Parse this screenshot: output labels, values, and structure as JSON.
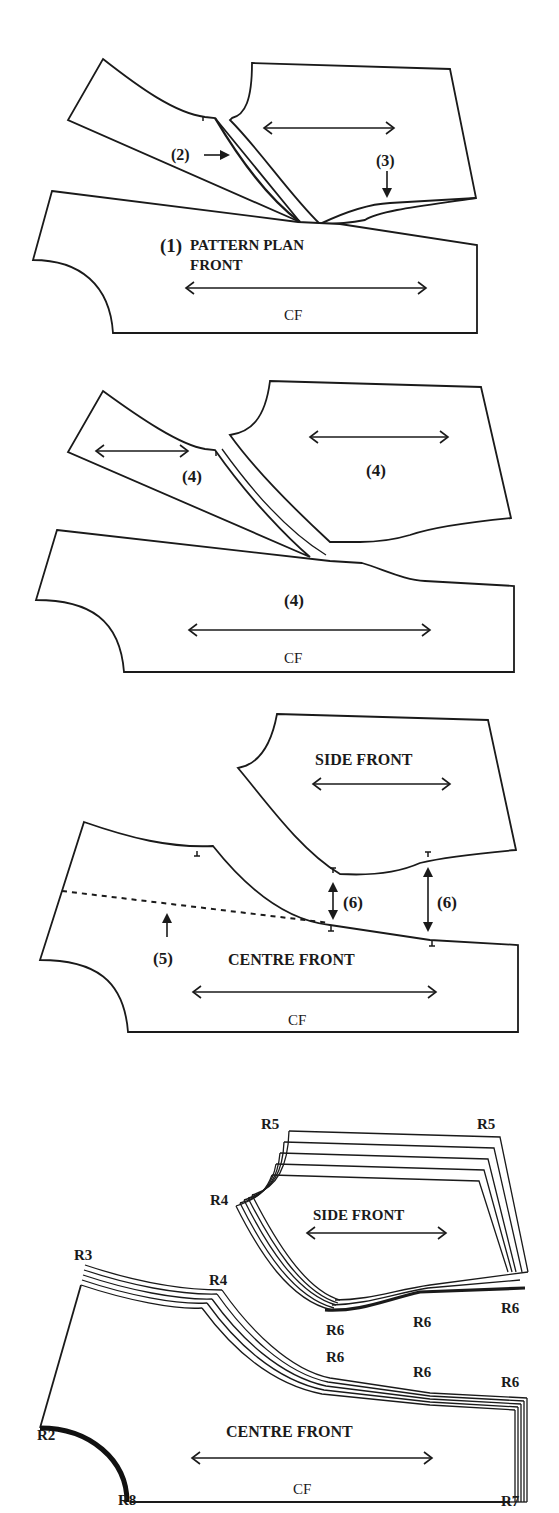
{
  "figure": {
    "panel1": {
      "step_marker": "(1)",
      "title_line1": "PATTERN PLAN",
      "title_line2": "FRONT",
      "marker_2": "(2)",
      "marker_3": "(3)",
      "grainline_label": "CF"
    },
    "panel2": {
      "marker_left": "(4)",
      "marker_right": "(4)",
      "marker_bottom": "(4)",
      "grainline_label": "CF"
    },
    "panel3": {
      "side_front_label": "SIDE FRONT",
      "centre_front_label": "CENTRE FRONT",
      "marker_5": "(5)",
      "marker_6a": "(6)",
      "marker_6b": "(6)",
      "grainline_label": "CF"
    },
    "panel4": {
      "side_front_label": "SIDE FRONT",
      "centre_front_label": "CENTRE FRONT",
      "grainline_label": "CF",
      "grade_points": {
        "r5_left": "R5",
        "r5_right": "R5",
        "r4_side": "R4",
        "r4_centre": "R4",
        "r3": "R3",
        "r2": "R2",
        "r8": "R8",
        "r7": "R7",
        "r6_side_left": "R6",
        "r6_side_mid": "R6",
        "r6_side_right": "R6",
        "r6_centre_left": "R6",
        "r6_centre_mid": "R6",
        "r6_centre_right": "R6"
      }
    }
  }
}
